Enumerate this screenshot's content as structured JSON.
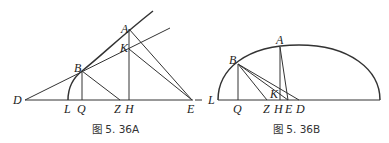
{
  "figures": [
    {
      "id": "5.36A",
      "caption": "图 5. 36A",
      "points": {
        "A": "A",
        "K": "K",
        "B": "B",
        "D": "D",
        "L": "L",
        "Q": "Q",
        "Z": "Z",
        "H": "H",
        "E": "E"
      }
    },
    {
      "id": "5.36B",
      "caption": "图 5. 36B",
      "points": {
        "A": "A",
        "B": "B",
        "K": "K",
        "L": "L",
        "Q": "Q",
        "Z": "Z",
        "H": "H",
        "E": "E",
        "D": "D"
      }
    }
  ],
  "colors": {
    "stroke": "#333333",
    "background": "#ffffff"
  }
}
